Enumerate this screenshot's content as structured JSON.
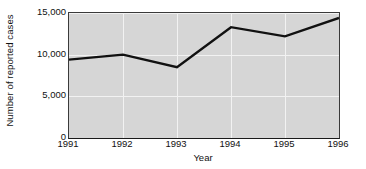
{
  "chart_data": {
    "type": "line",
    "title": "",
    "subtitle": "",
    "xlabel": "Year",
    "ylabel": "Number of reported cases",
    "categories": [
      "1991",
      "1992",
      "1993",
      "1994",
      "1995",
      "1996"
    ],
    "x": [
      1991,
      1992,
      1993,
      1994,
      1995,
      1996
    ],
    "values": [
      9400,
      10000,
      8500,
      13300,
      12200,
      14400
    ],
    "series": [
      {
        "name": "Reported cases",
        "values": [
          9400,
          10000,
          8500,
          13300,
          12200,
          14400
        ]
      }
    ],
    "xlim": [
      1991,
      1996
    ],
    "ylim": [
      0,
      15000
    ],
    "ytick_labels": [
      "0",
      "5,000",
      "10,000",
      "15,000"
    ],
    "ytick_values": [
      0,
      5000,
      10000,
      15000
    ],
    "xtick_labels": [
      "1991",
      "1992",
      "1993",
      "1994",
      "1995",
      "1996"
    ],
    "grid": true,
    "grid_color": "#f2f2f2",
    "legend": false,
    "legend_position": "none",
    "plot_background": "#d6d6d6",
    "figure_background": "#ffffff",
    "line_color": "#111111",
    "line_width": 2.4,
    "markers": false,
    "annotations": []
  }
}
